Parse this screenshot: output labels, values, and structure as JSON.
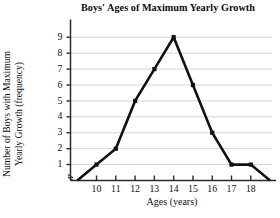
{
  "chart_data": {
    "type": "line",
    "title": "Boys' Ages of Maximum Yearly Growth",
    "xlabel": "Ages (years)",
    "ylabel_line1": "Number of Boys with Maximum",
    "ylabel_line2": "Yearly Growth (frequency)",
    "ylabel": "Number of Boys with Maximum Yearly Growth (frequency)",
    "x": [
      9,
      10,
      11,
      12,
      13,
      14,
      15,
      16,
      17,
      18,
      19
    ],
    "values": [
      0,
      1,
      2,
      5,
      7,
      9,
      6,
      3,
      1,
      1,
      0
    ],
    "xtick_labels": [
      "10",
      "11",
      "12",
      "13",
      "14",
      "15",
      "16",
      "17",
      "18"
    ],
    "xticks": [
      10,
      11,
      12,
      13,
      14,
      15,
      16,
      17,
      18
    ],
    "ytick_labels": [
      "1",
      "2",
      "3",
      "4",
      "5",
      "6",
      "7",
      "8",
      "9"
    ],
    "yticks": [
      1,
      2,
      3,
      4,
      5,
      6,
      7,
      8,
      9
    ],
    "xlim": [
      8.65,
      19.1
    ],
    "ylim": [
      0,
      9.55
    ],
    "grid": "horizontal",
    "legend": "none",
    "line_color": "#111111",
    "marker": "square",
    "grid_color": "#c9c9c9",
    "axis_color": "#2b2b2b",
    "axis_break": "y-axis break mark at origin"
  }
}
